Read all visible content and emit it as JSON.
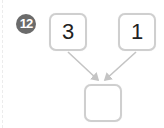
{
  "problem": {
    "number": "12",
    "inputs": [
      {
        "value": "3"
      },
      {
        "value": "1"
      }
    ],
    "result": {
      "value": ""
    }
  },
  "colors": {
    "badge_bg": "#6b6b6b",
    "box_border": "#cfcfcf",
    "arrow": "#c4c4c4",
    "text": "#222222"
  }
}
